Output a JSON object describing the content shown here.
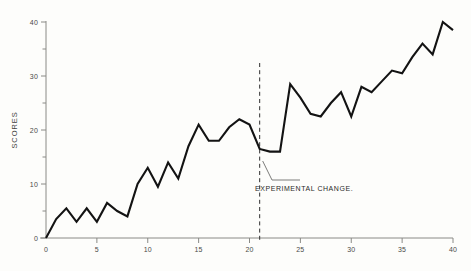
{
  "chart_data": {
    "type": "line",
    "title": "",
    "xlabel": "",
    "ylabel": "SCORES",
    "xlim": [
      0,
      40
    ],
    "ylim": [
      0,
      42
    ],
    "grid": false,
    "legend": null,
    "x_ticks_major": [
      0,
      5,
      10,
      15,
      20,
      25,
      30,
      35,
      40
    ],
    "x_tick_labels": [
      "0",
      "5",
      "10",
      "15",
      "20",
      "25",
      "30",
      "35",
      "40"
    ],
    "y_ticks_major": [
      0,
      10,
      20,
      30,
      40
    ],
    "y_tick_labels": [
      "0",
      "10",
      "20",
      "30",
      "40"
    ],
    "y_ticks_minor": [
      5,
      15,
      25,
      35
    ],
    "x": [
      0,
      1,
      2,
      3,
      4,
      5,
      6,
      7,
      8,
      9,
      10,
      11,
      12,
      13,
      14,
      15,
      16,
      17,
      18,
      19,
      20,
      21,
      22,
      23,
      24,
      25,
      26,
      27,
      28,
      29,
      30,
      31,
      32,
      33,
      34,
      35,
      36,
      37,
      38,
      39,
      40
    ],
    "y": [
      0,
      3.5,
      5.5,
      3.0,
      5.5,
      3.0,
      6.5,
      5.0,
      4.0,
      10.0,
      13.0,
      9.5,
      14.0,
      11.0,
      17.0,
      21.0,
      18.0,
      18.0,
      20.5,
      22.0,
      21.0,
      16.5,
      16.0,
      16.0,
      28.5,
      26.0,
      23.0,
      22.5,
      25.0,
      27.0,
      22.5,
      28.0,
      27.0,
      29.0,
      31.0,
      30.5,
      33.5,
      36.0,
      34.0,
      40.0,
      38.5
    ],
    "series": [
      {
        "name": "scores",
        "color": "#131313",
        "values": [
          0,
          3.5,
          5.5,
          3.0,
          5.5,
          3.0,
          6.5,
          5.0,
          4.0,
          10.0,
          13.0,
          9.5,
          14.0,
          11.0,
          17.0,
          21.0,
          18.0,
          18.0,
          20.5,
          22.0,
          21.0,
          16.5,
          16.0,
          16.0,
          28.5,
          26.0,
          23.0,
          22.5,
          25.0,
          27.0,
          22.5,
          28.0,
          27.0,
          29.0,
          31.0,
          30.5,
          33.5,
          36.0,
          34.0,
          40.0,
          38.5
        ]
      }
    ],
    "annotations": [
      {
        "name": "experimental-change",
        "text": "EXPERIMENTAL  CHANGE.",
        "x": 21,
        "type": "vertical-dashed-line-with-label"
      }
    ]
  }
}
